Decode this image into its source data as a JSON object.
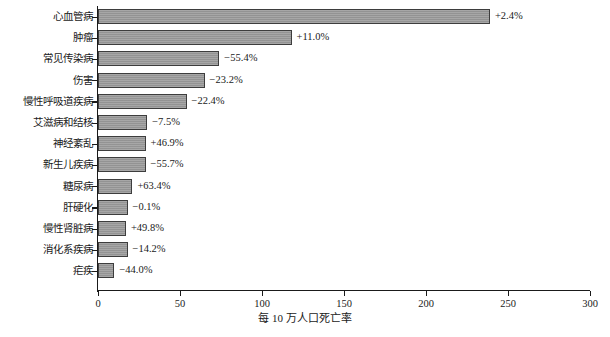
{
  "chart_data": {
    "type": "bar",
    "orientation": "horizontal",
    "title": "",
    "xlabel": "每 10 万人口死亡率",
    "ylabel": "",
    "xlim": [
      0,
      300
    ],
    "xticks": [
      0,
      50,
      100,
      150,
      200,
      250,
      300
    ],
    "xtick_labels": [
      "0",
      "50",
      "100",
      "150",
      "200",
      "250",
      "300"
    ],
    "grid": false,
    "legend": null,
    "bar_color": "#9b9b9b",
    "bar_edge_color": "#3d3d3d",
    "axis_color": "#1a1a1a",
    "categories": [
      "心血管病",
      "肿瘤",
      "常见传染病",
      "伤害",
      "慢性呼吸道疾病",
      "艾滋病和结核",
      "神经紊乱",
      "新生儿疾病",
      "糖尿病",
      "肝硬化",
      "慢性肾脏病",
      "消化系疾病",
      "疟疾"
    ],
    "values": [
      239,
      118,
      74,
      65,
      54,
      30,
      29,
      29,
      21,
      18,
      17,
      18,
      10
    ],
    "annotations": [
      "+2.4%",
      "+11.0%",
      "−55.4%",
      "−23.2%",
      "−22.4%",
      "−7.5%",
      "+46.9%",
      "−55.7%",
      "+63.4%",
      "−0.1%",
      "+49.8%",
      "−14.2%",
      "−44.0%"
    ]
  }
}
